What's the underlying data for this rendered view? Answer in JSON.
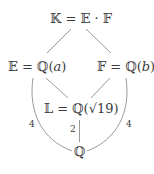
{
  "diagram": {
    "type": "field-extension-lattice",
    "nodes": {
      "top": "𝕂 = 𝔼 · 𝔽",
      "left": "𝔼 = ℚ(𝑎)",
      "right": "𝔽 = ℚ(𝑏)",
      "middle": "𝕃 = ℚ(√19)",
      "bottom": "ℚ"
    },
    "edge_labels": {
      "left_curve": "4",
      "right_curve": "4",
      "middle_vertical": "2"
    },
    "edges": [
      {
        "from": "top",
        "to": "left"
      },
      {
        "from": "top",
        "to": "right"
      },
      {
        "from": "left",
        "to": "middle"
      },
      {
        "from": "right",
        "to": "middle"
      },
      {
        "from": "middle",
        "to": "bottom",
        "label": "2"
      },
      {
        "from": "left",
        "to": "bottom",
        "label": "4",
        "curved": true
      },
      {
        "from": "right",
        "to": "bottom",
        "label": "4",
        "curved": true
      }
    ],
    "line_color": "#7a7a7a"
  }
}
